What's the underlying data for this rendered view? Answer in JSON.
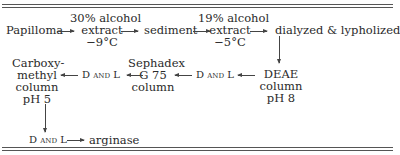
{
  "diagram": {
    "type": "flowchart",
    "title": "",
    "nodes": {
      "papilloma": "Papilloma",
      "extract1": {
        "top": "30% alcohol",
        "mid": "extract",
        "bottom": "−9°C"
      },
      "sediment": "sediment",
      "extract2": {
        "top": "19% alcohol",
        "mid": "extract",
        "bottom": "−5°C"
      },
      "dialyzed": "dialyzed & lypholized",
      "deae": {
        "l1": "DEAE",
        "l2": "column",
        "l3": "pH 8"
      },
      "dl1": "D and L",
      "sephadex": {
        "l1": "Sephadex",
        "l2": "G 75",
        "l3": "column"
      },
      "dl2": "D and L",
      "carboxymethyl": {
        "l1": "Carboxy-",
        "l2": "methyl",
        "l3": "column",
        "l4": "pH 5"
      },
      "dl3": "D and L",
      "arginase": "arginase"
    },
    "edges": [
      [
        "Papilloma",
        "30% alcohol extract −9°C"
      ],
      [
        "30% alcohol extract −9°C",
        "sediment"
      ],
      [
        "sediment",
        "19% alcohol extract −5°C"
      ],
      [
        "19% alcohol extract −5°C",
        "dialyzed & lypholized"
      ],
      [
        "dialyzed & lypholized",
        "DEAE column pH 8"
      ],
      [
        "DEAE column pH 8",
        "D and L"
      ],
      [
        "D and L",
        "Sephadex G 75 column"
      ],
      [
        "Sephadex G 75 column",
        "D and L"
      ],
      [
        "D and L",
        "Carboxymethyl column pH 5"
      ],
      [
        "Carboxymethyl column pH 5",
        "D and L"
      ],
      [
        "D and L",
        "arginase"
      ]
    ]
  }
}
